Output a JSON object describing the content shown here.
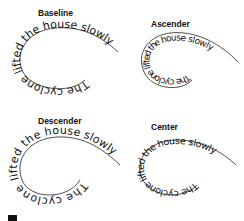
{
  "figure": {
    "phrase": "The cyclone lifted the house slowly",
    "panels": [
      {
        "id": "baseline",
        "label": "Baseline",
        "alignment": "baseline"
      },
      {
        "id": "ascender",
        "label": "Ascender",
        "alignment": "ascender"
      },
      {
        "id": "descender",
        "label": "Descender",
        "alignment": "descender"
      },
      {
        "id": "center",
        "label": "Center",
        "alignment": "center"
      }
    ],
    "colors": {
      "text": "#111111",
      "path": "#222222",
      "background": "#ffffff"
    }
  }
}
